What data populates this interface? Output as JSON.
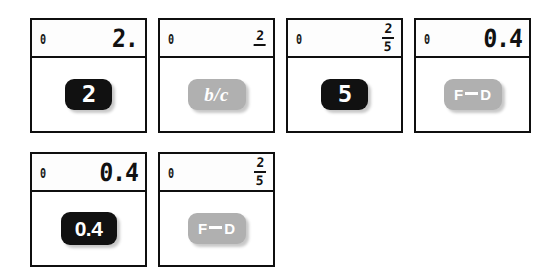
{
  "page": {
    "background_color": "#ffffff",
    "key_dark_color": "#111111",
    "key_gray_color": "#b0b0b0",
    "border_color": "#0f0f0f"
  },
  "rows": [
    {
      "panels": [
        {
          "display": {
            "left": "0",
            "main": "2.",
            "numerator": "",
            "denominator": "",
            "type": "number"
          },
          "key": {
            "label": "2",
            "style": "dark",
            "shape": "digit",
            "name": "key-two"
          }
        },
        {
          "display": {
            "left": "0",
            "main": "",
            "numerator": "2",
            "denominator": "",
            "type": "fraction-partial"
          },
          "key": {
            "label": "b/c",
            "style": "gray",
            "shape": "wide-bc",
            "name": "key-b-over-c"
          }
        },
        {
          "display": {
            "left": "0",
            "main": "",
            "numerator": "2",
            "denominator": "5",
            "type": "fraction"
          },
          "key": {
            "label": "5",
            "style": "dark",
            "shape": "digit",
            "name": "key-five"
          }
        },
        {
          "display": {
            "left": "0",
            "main": "0.4",
            "numerator": "",
            "denominator": "",
            "type": "number"
          },
          "key": {
            "label_left": "F",
            "label_right": "D",
            "style": "gray",
            "shape": "wide-fd",
            "name": "key-fraction-decimal"
          }
        }
      ]
    },
    {
      "panels": [
        {
          "display": {
            "left": "0",
            "main": "0.4",
            "numerator": "",
            "denominator": "",
            "type": "number"
          },
          "key": {
            "label": "0.4",
            "style": "dark",
            "shape": "decimal",
            "name": "key-zero-point-four"
          }
        },
        {
          "display": {
            "left": "0",
            "main": "",
            "numerator": "2",
            "denominator": "5",
            "type": "fraction"
          },
          "key": {
            "label_left": "F",
            "label_right": "D",
            "style": "gray",
            "shape": "wide-fd",
            "name": "key-fraction-decimal"
          }
        }
      ]
    }
  ]
}
